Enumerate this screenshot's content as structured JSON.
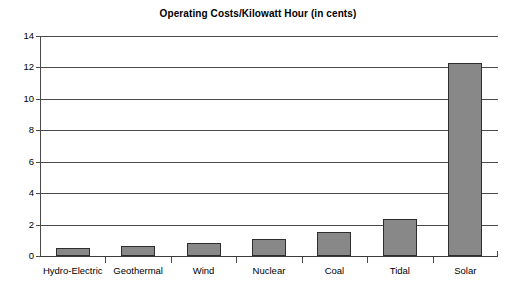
{
  "chart_data": {
    "type": "bar",
    "title": "Operating Costs/Kilowatt Hour (in cents)",
    "xlabel": "",
    "ylabel": "",
    "categories": [
      "Hydro-Electric",
      "Geothermal",
      "Wind",
      "Nuclear",
      "Coal",
      "Tidal",
      "Solar"
    ],
    "values": [
      0.5,
      0.65,
      0.8,
      1.1,
      1.5,
      2.35,
      12.3
    ],
    "ylim": [
      0,
      14
    ],
    "ytick_labels": [
      "0",
      "2",
      "4",
      "6",
      "8",
      "10",
      "12",
      "14"
    ],
    "ytick_values": [
      0,
      2,
      4,
      6,
      8,
      10,
      12,
      14
    ],
    "grid": "horizontal",
    "legend": "none",
    "colors": {
      "bar_fill": "#888888",
      "bar_border": "#2e2e2e",
      "grid": "#4a4a4a",
      "axis": "#4a4a4a",
      "text": "#000000",
      "background": "#ffffff"
    }
  }
}
